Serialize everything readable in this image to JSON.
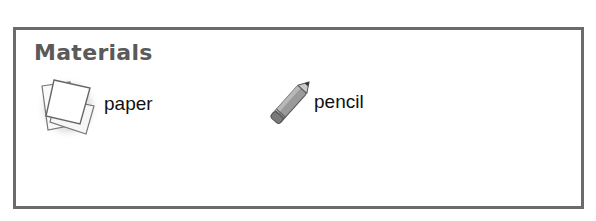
{
  "section": {
    "title": "Materials",
    "items": [
      {
        "label": "paper",
        "icon": "paper-stack-icon"
      },
      {
        "label": "pencil",
        "icon": "pencil-icon"
      }
    ]
  },
  "colors": {
    "border": "#6b6b6b",
    "title": "#5a5a5a",
    "text": "#111111"
  }
}
